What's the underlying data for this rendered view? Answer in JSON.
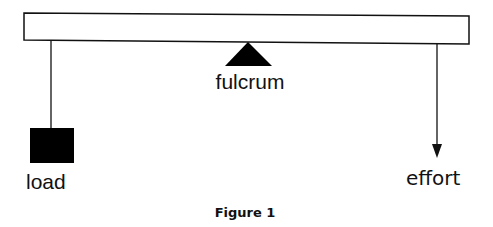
{
  "diagram": {
    "labels": {
      "fulcrum": "fulcrum",
      "load": "load",
      "effort": "effort"
    },
    "caption": "Figure 1",
    "colors": {
      "stroke": "#111111",
      "fill": "#000000",
      "background": "#ffffff"
    }
  }
}
